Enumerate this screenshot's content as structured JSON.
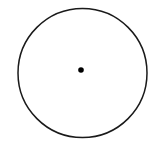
{
  "figure": {
    "type": "geometric-diagram",
    "title": "Circle with marked center point",
    "background_color": "#ffffff",
    "canvas": {
      "width": 165,
      "height": 149
    },
    "shapes": {
      "circle": {
        "label": "circle-outline",
        "center_x": 82.5,
        "center_y": 73,
        "radius": 64.5,
        "stroke_color": "#1a1a1a",
        "stroke_width": 1.5,
        "fill": "none"
      },
      "center_point": {
        "label": "center-point-dot",
        "center_x": 81,
        "center_y": 70,
        "radius": 2.8,
        "fill_color": "#000000",
        "stroke": "none"
      }
    },
    "annotations": [],
    "axis_labels": [],
    "legend": []
  }
}
